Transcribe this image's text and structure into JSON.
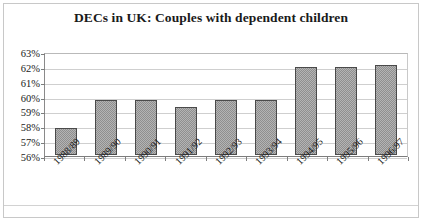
{
  "chart_data": {
    "type": "bar",
    "title": "DECs in UK: Couples with dependent children",
    "xlabel": "",
    "ylabel": "",
    "categories": [
      "1988/89",
      "1989/90",
      "1990/91",
      "1991/92",
      "1992/93",
      "1993/94",
      "1994/95",
      "1995/96",
      "1996/97"
    ],
    "values": [
      57.9,
      59.8,
      59.8,
      59.3,
      59.8,
      59.8,
      62.0,
      62.0,
      62.1
    ],
    "ylim": [
      56,
      63
    ],
    "ytick_labels": [
      "63%",
      "62%",
      "61%",
      "60%",
      "59%",
      "58%",
      "57%",
      "56%"
    ],
    "ytick_values": [
      63,
      62,
      61,
      60,
      59,
      58,
      57,
      56
    ],
    "grid": true,
    "legend": false,
    "series_name": "Couples with dependent children",
    "bar_fill_color": "#b4b4b4",
    "bar_border_color": "#4a4a4a",
    "gridline_color": "#cfcfcf",
    "axis_color": "#7d7d7d",
    "text_color": "#1a1a1a",
    "background_color": "#ffffff"
  }
}
